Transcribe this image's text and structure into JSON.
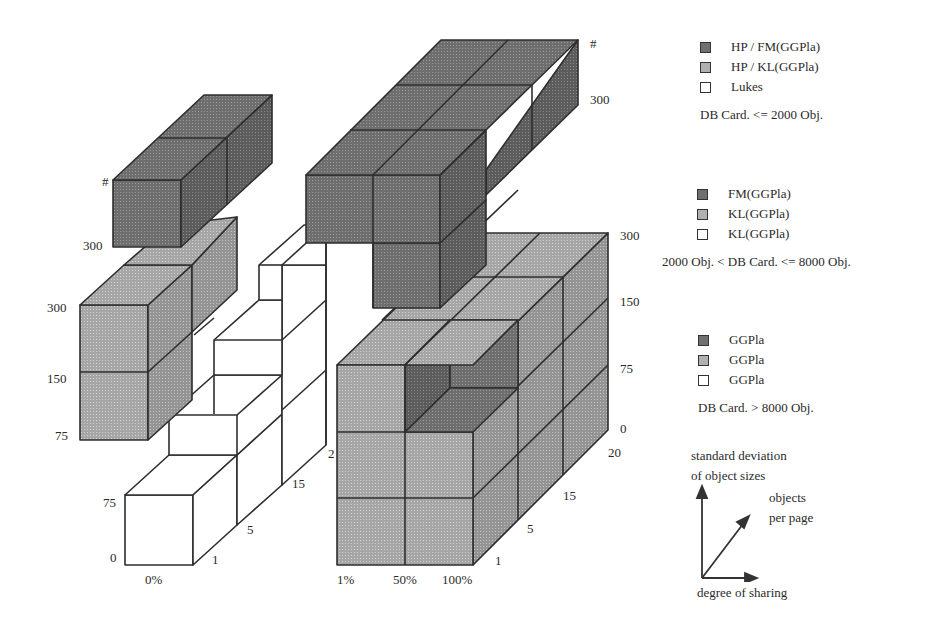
{
  "figure": {
    "type": "3d-block-diagram"
  },
  "axes": {
    "left_block": {
      "x_ticks": [
        "0%"
      ],
      "depth_ticks": [
        "1",
        "5",
        "15",
        "2"
      ],
      "y_ticks_lower": [
        "0",
        "75"
      ],
      "y_ticks_upper": [
        "75",
        "150",
        "300"
      ],
      "y_ticks_top": [
        "300",
        "#"
      ]
    },
    "right_block": {
      "x_ticks": [
        "1%",
        "50%",
        "100%"
      ],
      "depth_ticks": [
        "1",
        "5",
        "15",
        "20"
      ],
      "y_ticks": [
        "0",
        "75",
        "150",
        "300"
      ],
      "y_ticks_top": [
        "300",
        "#"
      ]
    }
  },
  "legend": {
    "groups": [
      {
        "items": [
          {
            "swatch": "dark",
            "label": "HP / FM(GGPla)"
          },
          {
            "swatch": "mid",
            "label": "HP / KL(GGPla)"
          },
          {
            "swatch": "white",
            "label": "Lukes"
          }
        ],
        "caption": "DB Card. <= 2000 Obj."
      },
      {
        "items": [
          {
            "swatch": "dark",
            "label": "FM(GGPla)"
          },
          {
            "swatch": "mid",
            "label": "KL(GGPla)"
          },
          {
            "swatch": "white",
            "label": "KL(GGPla)"
          }
        ],
        "caption": "2000 Obj. < DB Card. <= 8000 Obj."
      },
      {
        "items": [
          {
            "swatch": "dark",
            "label": "GGPla"
          },
          {
            "swatch": "mid",
            "label": "GGPla"
          },
          {
            "swatch": "white",
            "label": "GGPla"
          }
        ],
        "caption": "DB Card. > 8000 Obj."
      }
    ]
  },
  "axes_key": {
    "vertical": "standard deviation",
    "vertical2": "of object sizes",
    "diagonal": "objects",
    "diagonal2": "per page",
    "horizontal": "degree of sharing"
  },
  "colors": {
    "dark": "#6e6e6e",
    "dark_side": "#5e5e5e",
    "dark_top": "#7a7a7a",
    "mid": "#a8a8a8",
    "mid_side": "#959595",
    "mid_top": "#b8b8b8",
    "edge": "#2e2e2e"
  }
}
